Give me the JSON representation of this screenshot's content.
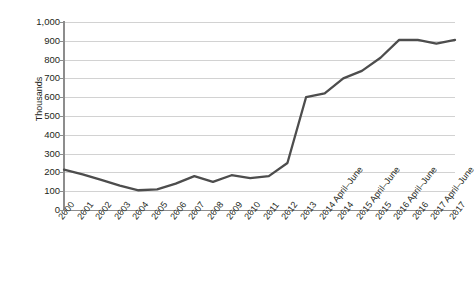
{
  "chart_data": {
    "type": "line",
    "title": "",
    "xlabel": "",
    "ylabel": "Thousands",
    "ylim": [
      0,
      1000
    ],
    "ytick_step": 100,
    "yticks": [
      "0",
      "100",
      "200",
      "300",
      "400",
      "500",
      "600",
      "700",
      "800",
      "900",
      "1,000"
    ],
    "grid": true,
    "legend": false,
    "line_color": "#4d4d4d",
    "categories": [
      "2000",
      "2001",
      "2002",
      "2003",
      "2004",
      "2005",
      "2006",
      "2007",
      "2008",
      "2009",
      "2010",
      "2011",
      "2012",
      "2013",
      "2014 April–June",
      "2014",
      "2015 April–June",
      "2015",
      "2016 April–June",
      "2016",
      "2017 April–June",
      "2017"
    ],
    "values": [
      215,
      190,
      160,
      130,
      105,
      110,
      140,
      180,
      150,
      185,
      170,
      180,
      250,
      600,
      620,
      700,
      740,
      810,
      905,
      905,
      885,
      905
    ],
    "series": [
      {
        "name": "",
        "values": [
          215,
          190,
          160,
          130,
          105,
          110,
          140,
          180,
          150,
          185,
          170,
          180,
          250,
          600,
          620,
          700,
          740,
          810,
          905,
          905,
          885,
          905
        ]
      }
    ]
  },
  "axes": {
    "y_title": "Thousands"
  }
}
